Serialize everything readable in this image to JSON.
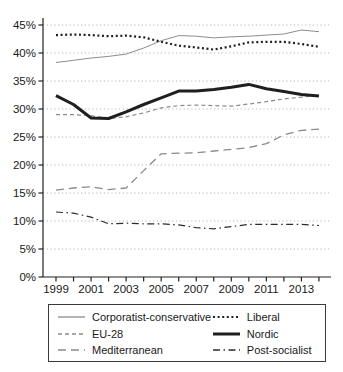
{
  "chart_data": {
    "type": "line",
    "title": "",
    "xlabel": "",
    "ylabel": "",
    "x": [
      1999,
      2000,
      2001,
      2002,
      2003,
      2004,
      2005,
      2006,
      2007,
      2008,
      2009,
      2010,
      2011,
      2012,
      2013,
      2014
    ],
    "x_tick_labels": [
      "1999",
      "2001",
      "2003",
      "2005",
      "2007",
      "2009",
      "2011",
      "2013"
    ],
    "y_tick_labels": [
      "0%",
      "5%",
      "10%",
      "15%",
      "20%",
      "25%",
      "30%",
      "35%",
      "40%",
      "45%"
    ],
    "ylim": [
      0,
      45
    ],
    "grid": "horizontal-dotted",
    "legend_position": "bottom-box-two-columns",
    "series": [
      {
        "name": "Corporatist-conservative",
        "color": "#8c8c8c",
        "width": 1,
        "dash": "",
        "values": [
          38.3,
          38.7,
          39.1,
          39.4,
          39.8,
          40.9,
          42.2,
          43.1,
          43.0,
          42.7,
          42.9,
          43.0,
          43.2,
          43.4,
          44.1,
          43.8
        ]
      },
      {
        "name": "Liberal",
        "color": "#1f1f1f",
        "width": 2.2,
        "dash": "2 2.6",
        "values": [
          43.2,
          43.3,
          43.2,
          43.0,
          43.1,
          42.8,
          42.0,
          41.3,
          41.0,
          40.6,
          41.2,
          41.9,
          42.0,
          42.0,
          41.6,
          41.1
        ]
      },
      {
        "name": "EU-28",
        "color": "#8a8a8a",
        "width": 1.2,
        "dash": "4 3",
        "values": [
          29.0,
          29.0,
          28.8,
          28.3,
          28.6,
          29.3,
          30.2,
          30.6,
          30.7,
          30.6,
          30.5,
          30.9,
          31.3,
          31.8,
          32.1,
          32.5
        ]
      },
      {
        "name": "Nordic",
        "color": "#1f1f1f",
        "width": 3,
        "dash": "",
        "values": [
          32.4,
          30.8,
          28.4,
          28.3,
          29.5,
          30.8,
          32.0,
          33.2,
          33.2,
          33.5,
          33.9,
          34.4,
          33.6,
          33.1,
          32.6,
          32.3
        ]
      },
      {
        "name": "Mediterranean",
        "color": "#8a8a8a",
        "width": 1.3,
        "dash": "8 5",
        "values": [
          15.5,
          15.9,
          16.1,
          15.6,
          15.9,
          19.0,
          22.0,
          22.1,
          22.2,
          22.5,
          22.8,
          23.1,
          23.8,
          25.4,
          26.2,
          26.4
        ]
      },
      {
        "name": "Post-socialist",
        "color": "#2b2b2b",
        "width": 1.2,
        "dash": "7 3.5 1.5 3.5",
        "values": [
          11.6,
          11.4,
          10.7,
          9.5,
          9.6,
          9.5,
          9.5,
          9.3,
          8.8,
          8.6,
          9.0,
          9.4,
          9.4,
          9.4,
          9.4,
          9.2
        ]
      }
    ]
  },
  "colors": {
    "axis": "#222222",
    "grid": "#b5b5b5",
    "text": "#191919",
    "legend_border": "#3a3a3a",
    "background": "#ffffff"
  }
}
